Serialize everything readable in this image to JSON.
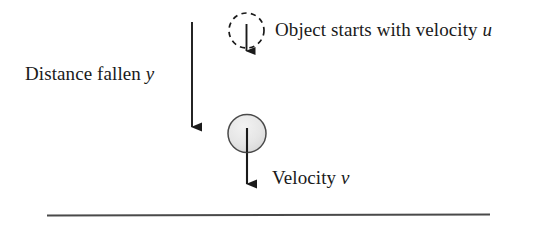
{
  "figure": {
    "kind": "physics-free-fall-diagram",
    "background_color": "#ffffff",
    "stroke_color": "#1a1a1a",
    "ball_fill_color": "#e8e8e8",
    "ground_line_color": "#4a4a4a",
    "labels": {
      "distance_fallen": {
        "text": "Distance fallen",
        "symbol": "y"
      },
      "object_starts": {
        "text": "Object starts with velocity",
        "symbol": "u"
      },
      "velocity": {
        "text": "Velocity",
        "symbol": "v"
      }
    },
    "elements": {
      "dashed_circle_name": "initial-position-marker",
      "solid_ball_name": "falling-object",
      "distance_arrow_name": "distance-fallen-arrow",
      "initial_velocity_arrow_name": "initial-velocity-arrow",
      "final_velocity_arrow_name": "final-velocity-arrow",
      "ground_line_name": "ground-line"
    }
  }
}
